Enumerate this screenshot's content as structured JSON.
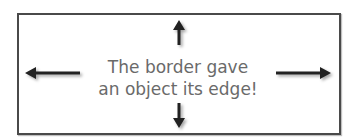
{
  "caption": {
    "line1": "The border gave",
    "line2": "an object its edge!"
  },
  "arrows": [
    "arrow-up-icon",
    "arrow-down-icon",
    "arrow-left-icon",
    "arrow-right-icon"
  ],
  "colors": {
    "border": "#4a4a4a",
    "text": "#6a6a6a",
    "arrow": "#222222",
    "background": "#ffffff"
  }
}
